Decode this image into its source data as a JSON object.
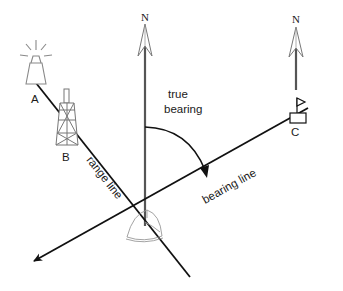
{
  "diagram": {
    "labels": {
      "north_main": "N",
      "north_c": "N",
      "true_bearing_line1": "true",
      "true_bearing_line2": "bearing",
      "range_line": "range line",
      "bearing_line": "bearing line",
      "point_a": "A",
      "point_b": "B",
      "point_c": "C"
    },
    "landmarks": [
      {
        "id": "A",
        "type": "lighthouse",
        "x": 36,
        "y": 60
      },
      {
        "id": "B",
        "type": "tower",
        "x": 67,
        "y": 115
      },
      {
        "id": "C",
        "type": "flag-marker",
        "x": 297,
        "y": 116
      }
    ],
    "lines": [
      {
        "name": "range line",
        "from": [
          36,
          83
        ],
        "to": [
          190,
          277
        ]
      },
      {
        "name": "bearing line",
        "from": [
          308,
          108
        ],
        "to": [
          33,
          262
        ],
        "arrow": "end"
      },
      {
        "name": "north reference main",
        "from": [
          145,
          225
        ],
        "to": [
          145,
          10
        ],
        "arrow": "north"
      },
      {
        "name": "north reference C",
        "from": [
          296,
          90
        ],
        "to": [
          296,
          12
        ],
        "arrow": "north"
      }
    ],
    "colors": {
      "line": "#111111",
      "north_arrow": "#555555",
      "icon_stroke": "#888888",
      "background": "#ffffff"
    }
  }
}
